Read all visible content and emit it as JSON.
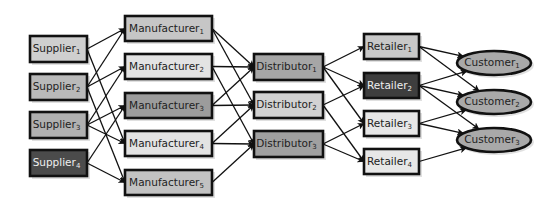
{
  "diagram": {
    "colors": {
      "stroke": "#111111",
      "edge": "#111111",
      "text_dark": "#222222",
      "text_light": "#eeeeee"
    },
    "tiers": [
      {
        "name": "suppliers",
        "shape": "rect",
        "nodes": [
          {
            "id": "S1",
            "label": "Supplier",
            "sub": "1",
            "x": 30,
            "y": 36,
            "w": 57,
            "h": 26,
            "fill": "#cfcfcf",
            "text": "#222222"
          },
          {
            "id": "S2",
            "label": "Supplier",
            "sub": "2",
            "x": 30,
            "y": 74,
            "w": 57,
            "h": 26,
            "fill": "#b9b9b9",
            "text": "#222222"
          },
          {
            "id": "S3",
            "label": "Supplier",
            "sub": "3",
            "x": 30,
            "y": 112,
            "w": 57,
            "h": 26,
            "fill": "#b0b0b0",
            "text": "#222222"
          },
          {
            "id": "S4",
            "label": "Supplier",
            "sub": "4",
            "x": 30,
            "y": 150,
            "w": 57,
            "h": 26,
            "fill": "#4b4b4b",
            "text": "#eeeeee"
          }
        ]
      },
      {
        "name": "manufacturers",
        "shape": "rect",
        "nodes": [
          {
            "id": "M1",
            "label": "Manufacturer",
            "sub": "1",
            "x": 125,
            "y": 16,
            "w": 87,
            "h": 25,
            "fill": "#c6c6c6",
            "text": "#222222"
          },
          {
            "id": "M2",
            "label": "Manufacturer",
            "sub": "2",
            "x": 125,
            "y": 54,
            "w": 87,
            "h": 25,
            "fill": "#e3e3e3",
            "text": "#222222"
          },
          {
            "id": "M3",
            "label": "Manufacturer",
            "sub": "3",
            "x": 125,
            "y": 93,
            "w": 87,
            "h": 25,
            "fill": "#9c9c9c",
            "text": "#222222"
          },
          {
            "id": "M4",
            "label": "Manufacturer",
            "sub": "4",
            "x": 125,
            "y": 131,
            "w": 87,
            "h": 25,
            "fill": "#e3e3e3",
            "text": "#222222"
          },
          {
            "id": "M5",
            "label": "Manufacturer",
            "sub": "5",
            "x": 125,
            "y": 170,
            "w": 87,
            "h": 25,
            "fill": "#c2c2c2",
            "text": "#222222"
          }
        ]
      },
      {
        "name": "distributors",
        "shape": "rect",
        "nodes": [
          {
            "id": "D1",
            "label": "Distributor",
            "sub": "1",
            "x": 254,
            "y": 54,
            "w": 69,
            "h": 26,
            "fill": "#a6a6a6",
            "text": "#222222"
          },
          {
            "id": "D2",
            "label": "Distributor",
            "sub": "2",
            "x": 254,
            "y": 92,
            "w": 69,
            "h": 26,
            "fill": "#d2d2d2",
            "text": "#222222"
          },
          {
            "id": "D3",
            "label": "Distributor",
            "sub": "3",
            "x": 254,
            "y": 131,
            "w": 69,
            "h": 26,
            "fill": "#a0a0a0",
            "text": "#222222"
          }
        ]
      },
      {
        "name": "retailers",
        "shape": "rect",
        "nodes": [
          {
            "id": "R1",
            "label": "Retailer",
            "sub": "1",
            "x": 364,
            "y": 34,
            "w": 55,
            "h": 25,
            "fill": "#c8c8c8",
            "text": "#222222"
          },
          {
            "id": "R2",
            "label": "Retailer",
            "sub": "2",
            "x": 364,
            "y": 73,
            "w": 55,
            "h": 25,
            "fill": "#3e3e3e",
            "text": "#eeeeee"
          },
          {
            "id": "R3",
            "label": "Retailer",
            "sub": "3",
            "x": 364,
            "y": 111,
            "w": 55,
            "h": 25,
            "fill": "#e7e7e7",
            "text": "#222222"
          },
          {
            "id": "R4",
            "label": "Retailer",
            "sub": "4",
            "x": 364,
            "y": 149,
            "w": 55,
            "h": 25,
            "fill": "#e7e7e7",
            "text": "#222222"
          }
        ]
      },
      {
        "name": "customers",
        "shape": "ellipse",
        "nodes": [
          {
            "id": "C1",
            "label": "Customer",
            "sub": "1",
            "cx": 494,
            "cy": 63,
            "rx": 37,
            "ry": 12,
            "fill": "#a9a9a9",
            "text": "#222222"
          },
          {
            "id": "C2",
            "label": "Customer",
            "sub": "2",
            "cx": 494,
            "cy": 102,
            "rx": 37,
            "ry": 12,
            "fill": "#a9a9a9",
            "text": "#222222"
          },
          {
            "id": "C3",
            "label": "Customer",
            "sub": "3",
            "cx": 494,
            "cy": 140,
            "rx": 37,
            "ry": 12,
            "fill": "#a9a9a9",
            "text": "#222222"
          }
        ]
      }
    ],
    "edges": [
      [
        "S1",
        "M1"
      ],
      [
        "S1",
        "M4"
      ],
      [
        "S2",
        "M1"
      ],
      [
        "S2",
        "M2"
      ],
      [
        "S2",
        "M5"
      ],
      [
        "S3",
        "M2"
      ],
      [
        "S3",
        "M3"
      ],
      [
        "S3",
        "M4"
      ],
      [
        "S4",
        "M3"
      ],
      [
        "S4",
        "M5"
      ],
      [
        "M1",
        "D1"
      ],
      [
        "M1",
        "D2"
      ],
      [
        "M2",
        "D1"
      ],
      [
        "M2",
        "D3"
      ],
      [
        "M3",
        "D1"
      ],
      [
        "M3",
        "D2"
      ],
      [
        "M4",
        "D2"
      ],
      [
        "M4",
        "D3"
      ],
      [
        "M5",
        "D3"
      ],
      [
        "D1",
        "R1"
      ],
      [
        "D1",
        "R2"
      ],
      [
        "D1",
        "R3"
      ],
      [
        "D2",
        "R2"
      ],
      [
        "D2",
        "R4"
      ],
      [
        "D3",
        "R3"
      ],
      [
        "D3",
        "R4"
      ],
      [
        "R1",
        "C1"
      ],
      [
        "R1",
        "C2"
      ],
      [
        "R2",
        "C1"
      ],
      [
        "R2",
        "C2"
      ],
      [
        "R2",
        "C3"
      ],
      [
        "R3",
        "C2"
      ],
      [
        "R3",
        "C3"
      ],
      [
        "R4",
        "C3"
      ]
    ]
  }
}
